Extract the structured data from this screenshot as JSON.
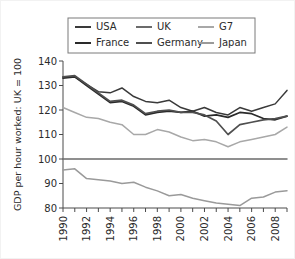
{
  "chart_data": {
    "type": "line",
    "title": "",
    "xlabel": "",
    "ylabel": "GDP per hour worked: UK = 100",
    "xlim": [
      1990,
      2009
    ],
    "ylim": [
      80,
      140
    ],
    "yticks": [
      80,
      90,
      100,
      110,
      120,
      130,
      140
    ],
    "xticks": [
      1990,
      1991,
      1992,
      1993,
      1994,
      1995,
      1996,
      1997,
      1998,
      1999,
      2000,
      2001,
      2002,
      2003,
      2004,
      2005,
      2006,
      2007,
      2008,
      2009
    ],
    "xtick_labels": [
      "1990",
      "",
      "1992",
      "",
      "1994",
      "",
      "1996",
      "",
      "1998",
      "",
      "2000",
      "",
      "2002",
      "",
      "2004",
      "",
      "2006",
      "",
      "2008",
      ""
    ],
    "grid": false,
    "legend_position": "top",
    "x": [
      1990,
      1991,
      1992,
      1993,
      1994,
      1995,
      1996,
      1997,
      1998,
      1999,
      2000,
      2001,
      2002,
      2003,
      2004,
      2005,
      2006,
      2007,
      2008,
      2009
    ],
    "series": [
      {
        "name": "USA",
        "color": "#3a3a3a",
        "width": 1.5,
        "values": [
          133.5,
          133.5,
          130.5,
          127.5,
          127.0,
          129.0,
          125.5,
          123.5,
          123.0,
          124.0,
          121.0,
          119.5,
          121.0,
          119.0,
          118.0,
          121.0,
          119.5,
          121.0,
          122.5,
          128.0
        ]
      },
      {
        "name": "UK",
        "color": "#6b6b6b",
        "width": 1.5,
        "values": [
          100,
          100,
          100,
          100,
          100,
          100,
          100,
          100,
          100,
          100,
          100,
          100,
          100,
          100,
          100,
          100,
          100,
          100,
          100,
          100
        ]
      },
      {
        "name": "G7",
        "color": "#a8a8a8",
        "width": 1.5,
        "values": [
          121.0,
          119.0,
          117.0,
          116.5,
          115.0,
          114.0,
          110.0,
          110.0,
          112.0,
          111.0,
          109.0,
          107.5,
          108.0,
          107.0,
          105.0,
          107.0,
          108.0,
          109.0,
          110.0,
          113.0
        ]
      },
      {
        "name": "France",
        "color": "#2a2a2a",
        "width": 1.7,
        "values": [
          133.0,
          133.5,
          130.0,
          126.5,
          123.0,
          123.5,
          121.5,
          118.0,
          119.0,
          119.5,
          119.0,
          119.5,
          117.5,
          118.0,
          117.0,
          119.0,
          118.5,
          116.5,
          116.0,
          117.5
        ]
      },
      {
        "name": "Germany",
        "color": "#4f4f4f",
        "width": 1.7,
        "values": [
          133.5,
          134.0,
          130.5,
          127.0,
          123.5,
          124.0,
          122.0,
          118.5,
          119.5,
          120.0,
          119.0,
          119.0,
          118.0,
          115.5,
          110.0,
          114.0,
          115.0,
          116.0,
          116.5,
          117.5
        ]
      },
      {
        "name": "Japan",
        "color": "#9a9a9a",
        "width": 1.5,
        "values": [
          95.5,
          96.0,
          92.0,
          91.5,
          91.0,
          90.0,
          90.5,
          88.5,
          87.0,
          85.0,
          85.5,
          84.0,
          83.0,
          82.0,
          81.5,
          81.0,
          84.0,
          84.5,
          86.5,
          87.0
        ]
      }
    ],
    "legend_rows": [
      [
        {
          "label": "USA",
          "color": "#3a3a3a"
        },
        {
          "label": "UK",
          "color": "#6b6b6b"
        },
        {
          "label": "G7",
          "color": "#a8a8a8"
        }
      ],
      [
        {
          "label": "France",
          "color": "#2a2a2a"
        },
        {
          "label": "Germany",
          "color": "#4f4f4f"
        },
        {
          "label": "Japan",
          "color": "#9a9a9a"
        }
      ]
    ]
  }
}
